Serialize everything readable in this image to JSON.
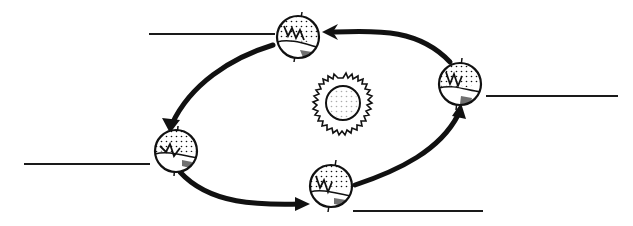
{
  "diagram": {
    "title": "",
    "colors": {
      "ink": "#111111",
      "background": "#ffffff"
    },
    "sun": {
      "label": ""
    },
    "earth_positions": [
      {
        "id": "top",
        "label": ""
      },
      {
        "id": "right",
        "label": ""
      },
      {
        "id": "left",
        "label": ""
      },
      {
        "id": "bottom",
        "label": ""
      }
    ],
    "blank_lines": [
      {
        "id": "top-left",
        "text": ""
      },
      {
        "id": "right",
        "text": ""
      },
      {
        "id": "left",
        "text": ""
      },
      {
        "id": "bottom",
        "text": ""
      }
    ],
    "orbit_direction": "counterclockwise"
  }
}
